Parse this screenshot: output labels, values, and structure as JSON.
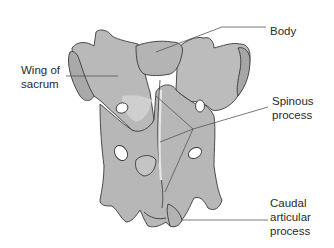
{
  "figure": {
    "colors": {
      "bone_fill": "#b9b9b9",
      "bone_highlight": "#d4d4d4",
      "bone_outline": "#3a3a3a",
      "leader_line": "#555555",
      "label_text": "#2a2a2a",
      "background": "#ffffff"
    }
  },
  "labels": {
    "body": "Body",
    "wing_line1": "Wing of",
    "wing_line2": "sacrum",
    "spinous_line1": "Spinous",
    "spinous_line2": "process",
    "caudal_line1": "Caudal",
    "caudal_line2": "articular",
    "caudal_line3": "process"
  }
}
